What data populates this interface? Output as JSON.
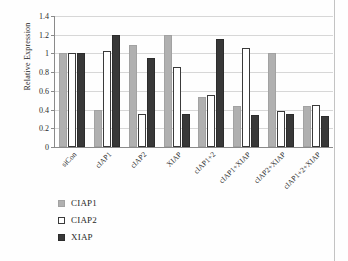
{
  "chart_data": {
    "type": "bar",
    "title": "",
    "xlabel": "",
    "ylabel": "Relative Expression",
    "ylim": [
      0,
      1.4
    ],
    "ytick_values": [
      1.4,
      1.2,
      1,
      0.8,
      0.6,
      0.4,
      0.2,
      0
    ],
    "ytick_labels": [
      "1.4",
      "1.2",
      "1",
      "0.8",
      "0.6",
      "0.4",
      "0.2",
      "0"
    ],
    "grid": true,
    "legend_position": "bottom-left",
    "categories": [
      "siCon",
      "cIAP1",
      "cIAP2",
      "XIAP",
      "cIAP1+2",
      "cIAP1+XIAP",
      "cIAP2+XIAP",
      "cIAP1+2+XIAP"
    ],
    "series": [
      {
        "name": "CIAP1",
        "color": "#b0b0b0",
        "values": [
          1.0,
          0.4,
          1.09,
          1.2,
          0.53,
          0.44,
          1.01,
          0.44
        ]
      },
      {
        "name": "CIAP2",
        "color": "#ffffff",
        "values": [
          1.0,
          1.03,
          0.35,
          0.85,
          0.56,
          1.06,
          0.39,
          0.445
        ]
      },
      {
        "name": "XIAP",
        "color": "#383838",
        "values": [
          1.0,
          1.2,
          0.95,
          0.35,
          1.15,
          0.34,
          0.35,
          0.335
        ]
      }
    ]
  }
}
